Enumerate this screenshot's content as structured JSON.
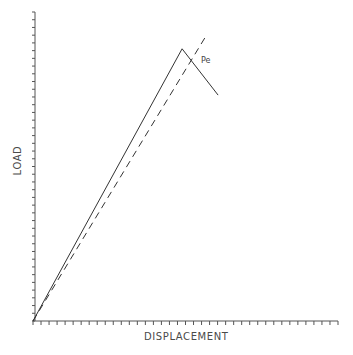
{
  "chart_data": {
    "type": "line",
    "title": "",
    "xlabel": "DISPLACEMENT",
    "ylabel": "LOAD",
    "grid": false,
    "legend": null,
    "x_ticks": 38,
    "y_ticks": 40,
    "tick_labels": false,
    "xlim": [
      0,
      1
    ],
    "ylim": [
      0,
      1
    ],
    "series": [
      {
        "name": "solid",
        "style": "solid",
        "points": [
          [
            0.0,
            0.0
          ],
          [
            0.489,
            0.881
          ],
          [
            0.607,
            0.731
          ]
        ]
      },
      {
        "name": "dashed",
        "style": "dashed",
        "points": [
          [
            0.0,
            0.0
          ],
          [
            0.564,
            0.917
          ]
        ]
      }
    ],
    "annotations": [
      {
        "text": "Pe",
        "x": 0.551,
        "y": 0.845
      }
    ]
  },
  "labels": {
    "x_axis": "DISPLACEMENT",
    "y_axis": "LOAD",
    "annotation": "Pe"
  },
  "colors": {
    "axis": "#555555",
    "line": "#333333",
    "text": "#4a4a4a"
  }
}
